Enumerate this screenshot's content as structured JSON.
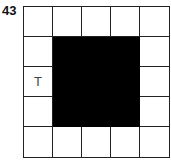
{
  "puzzle": {
    "number": "43",
    "rows": 5,
    "cols": 5,
    "cells": [
      [
        "",
        "",
        "",
        "",
        ""
      ],
      [
        "",
        "#",
        "#",
        "#",
        ""
      ],
      [
        "T",
        "#",
        "#",
        "#",
        ""
      ],
      [
        "",
        "#",
        "#",
        "#",
        ""
      ],
      [
        "",
        "",
        "",
        "",
        ""
      ]
    ],
    "colors": {
      "filled": "#000000",
      "empty": "#ffffff",
      "line": "#222222"
    }
  }
}
